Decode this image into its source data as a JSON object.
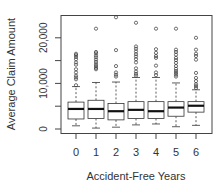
{
  "chart_data": {
    "type": "box",
    "title": "",
    "xlabel": "Accident-Free Years",
    "ylabel": "Average Claim Amount",
    "categories": [
      "0",
      "1",
      "2",
      "3",
      "4",
      "5",
      "6"
    ],
    "yticks": [
      0,
      10000,
      20000
    ],
    "ytick_labels": [
      "0",
      "10,000",
      "20,000"
    ],
    "yminor_ticks": [
      5000,
      15000
    ],
    "ylim": [
      -800,
      25500
    ],
    "grid": false,
    "legend": null,
    "boxes": [
      {
        "category": "0",
        "whisker_low": 700,
        "q1": 2200,
        "median": 4400,
        "q3": 5900,
        "whisker_high": 9300,
        "outliers": [
          9600,
          10900,
          11300,
          11700,
          12400,
          13100,
          14100,
          14600,
          15300,
          15800,
          16200,
          16500
        ]
      },
      {
        "category": "1",
        "whisker_low": 200,
        "q1": 2300,
        "median": 4400,
        "q3": 6300,
        "whisker_high": 10200,
        "outliers": [
          13100,
          13400,
          13800,
          14200,
          14700,
          15200,
          15700,
          16100,
          16600,
          16900,
          22000
        ]
      },
      {
        "category": "2",
        "whisker_low": 400,
        "q1": 2000,
        "median": 3900,
        "q3": 5600,
        "whisker_high": 10300,
        "outliers": [
          11500,
          11900,
          12400,
          13800,
          17300,
          24500
        ]
      },
      {
        "category": "3",
        "whisker_low": 900,
        "q1": 2300,
        "median": 4200,
        "q3": 6000,
        "whisker_high": 11300,
        "outliers": [
          11700,
          12100,
          12600,
          13300,
          14600,
          15300,
          15900,
          16400,
          17000,
          17600,
          18100,
          23300
        ]
      },
      {
        "category": "4",
        "whisker_low": 1100,
        "q1": 2300,
        "median": 3900,
        "q3": 6000,
        "whisker_high": 11300,
        "outliers": [
          11800,
          12400,
          13900,
          15600,
          16000,
          16700,
          17500,
          22000
        ]
      },
      {
        "category": "5",
        "whisker_low": 500,
        "q1": 2800,
        "median": 4700,
        "q3": 6000,
        "whisker_high": 10100,
        "outliers": [
          11500,
          11900,
          12300,
          12700,
          13200,
          13800,
          14500,
          15100,
          15600,
          16300,
          16900,
          17400,
          22000
        ]
      },
      {
        "category": "6",
        "whisker_low": 800,
        "q1": 3700,
        "median": 5100,
        "q3": 6000,
        "whisker_high": 8600,
        "outliers": [
          9000,
          9400,
          9800,
          10500,
          11200,
          12300,
          15200,
          16000,
          16500,
          17400,
          20000
        ]
      }
    ]
  },
  "colors": {
    "axis": "#444444",
    "box_stroke": "#333333",
    "median": "#111111",
    "outlier": "#333333",
    "text": "#333333"
  }
}
